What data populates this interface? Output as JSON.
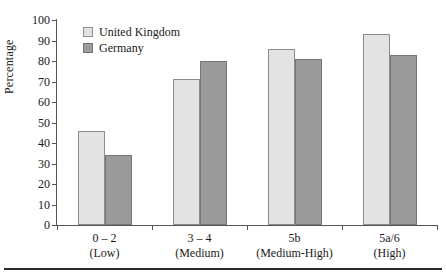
{
  "chart_data": {
    "type": "bar",
    "title": "",
    "xlabel": "",
    "ylabel": "Percentage",
    "ylim": [
      0,
      100
    ],
    "ytick_step": 10,
    "yticks": [
      0,
      10,
      20,
      30,
      40,
      50,
      60,
      70,
      80,
      90,
      100
    ],
    "grid": false,
    "legend_position": "top-left-inside",
    "categories": [
      {
        "line1": "0 – 2",
        "line2": "(Low)"
      },
      {
        "line1": "3 – 4",
        "line2": "(Medium)"
      },
      {
        "line1": "5b",
        "line2": "(Medium-High)"
      },
      {
        "line1": "5a/6",
        "line2": "(High)"
      }
    ],
    "series": [
      {
        "name": "United Kingdom",
        "color": "#e3e3e3",
        "values": [
          46,
          71,
          86,
          93
        ]
      },
      {
        "name": "Germany",
        "color": "#9a9a9a",
        "values": [
          34,
          80,
          81,
          83
        ]
      }
    ]
  },
  "legend": {
    "entries": [
      {
        "label": "United Kingdom",
        "swatch": "uk"
      },
      {
        "label": "Germany",
        "swatch": "de"
      }
    ]
  },
  "axes": {
    "y_title": "Percentage"
  }
}
